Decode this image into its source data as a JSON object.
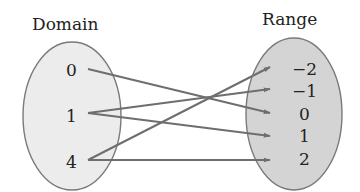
{
  "diagram": {
    "type": "mapping-diagram",
    "domain": {
      "title": "Domain",
      "values": [
        "0",
        "1",
        "4"
      ],
      "fill": "#ececec"
    },
    "range": {
      "title": "Range",
      "values": [
        "−2",
        "−1",
        "0",
        "1",
        "2"
      ],
      "fill": "#d4d4d4"
    },
    "arrows": [
      {
        "from": "0",
        "to": "0"
      },
      {
        "from": "1",
        "to": "−1"
      },
      {
        "from": "1",
        "to": "1"
      },
      {
        "from": "4",
        "to": "−2"
      },
      {
        "from": "4",
        "to": "2"
      }
    ],
    "colors": {
      "outline": "#7a7a7a",
      "arrow": "#6e6e6e",
      "text": "#222222"
    }
  }
}
